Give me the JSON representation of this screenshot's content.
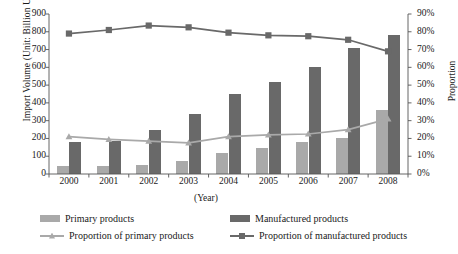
{
  "chart_data": {
    "type": "bar",
    "title": "",
    "xlabel": "(Year)",
    "ylabel": "Import Volume (Unit: Billion USD)",
    "ylabel_secondary": "Proportion",
    "categories": [
      "2000",
      "2001",
      "2002",
      "2003",
      "2004",
      "2005",
      "2006",
      "2007",
      "2008"
    ],
    "ylim": [
      0,
      900
    ],
    "yticks": [
      "900",
      "800",
      "700",
      "600",
      "500",
      "400",
      "300",
      "200",
      "100",
      "0"
    ],
    "ylim_secondary": [
      0,
      90
    ],
    "yticks_secondary": [
      "90%",
      "80%",
      "70%",
      "60%",
      "50%",
      "40%",
      "30%",
      "20%",
      "10%",
      "0%"
    ],
    "grid": false,
    "legend_position": "bottom",
    "series": [
      {
        "name": "Primary products",
        "type": "bar",
        "axis": "left",
        "color": "#a9a9a9",
        "values": [
          45,
          45,
          52,
          75,
          118,
          148,
          180,
          200,
          360
        ]
      },
      {
        "name": "Manufactured products",
        "type": "bar",
        "axis": "left",
        "color": "#696969",
        "values": [
          180,
          185,
          248,
          340,
          450,
          520,
          600,
          710,
          780
        ]
      },
      {
        "name": "Proportion of primary products",
        "type": "line",
        "axis": "right",
        "color": "#a9a9a9",
        "marker": "triangle",
        "values": [
          21,
          19.5,
          18.5,
          17.5,
          21,
          22,
          22.5,
          25,
          31
        ]
      },
      {
        "name": "Proportion of manufactured products",
        "type": "line",
        "axis": "right",
        "color": "#696969",
        "marker": "square",
        "values": [
          79,
          81,
          83.5,
          82.5,
          79.5,
          78,
          77.5,
          75.5,
          69
        ]
      }
    ]
  },
  "legend": [
    {
      "label": "Primary products"
    },
    {
      "label": "Manufactured products"
    },
    {
      "label": "Proportion of primary products"
    },
    {
      "label": "Proportion of manufactured products"
    }
  ]
}
